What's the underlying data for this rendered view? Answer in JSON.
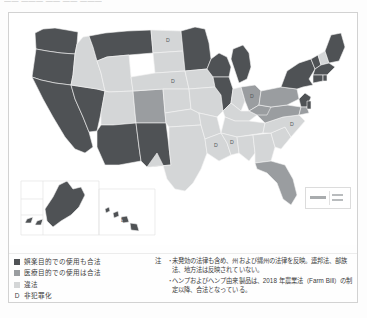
{
  "page": {
    "title_cutoff": "—— ——— ——  —— ———",
    "background_color": "#ffffff",
    "frame_color": "#d2d2d2"
  },
  "map": {
    "name": "united-states-cannabis-legality-choropleth",
    "projection_note": "contiguous US with Alaska and Hawaii insets",
    "colors": {
      "recreational_legal": "#4f5255",
      "medical_legal": "#9a9da0",
      "illegal": "#d4d6d7",
      "border": "#f2f2f2",
      "ocean": "#ffffff"
    },
    "state_letter_label": "D",
    "states_with_letter_label": [
      "ND",
      "NE",
      "OH",
      "NC",
      "MS",
      "LA",
      "HI"
    ]
  },
  "legend": {
    "items": [
      {
        "swatch": "rec",
        "label": "娯楽目的での使用も合法"
      },
      {
        "swatch": "med",
        "label": "医療目的での使用は合法"
      },
      {
        "swatch": "ill",
        "label": "違法"
      },
      {
        "swatch": "letter",
        "key": "D",
        "label": "非犯罪化"
      }
    ]
  },
  "notes": {
    "heading": "注",
    "items": [
      "未発効の法律も含め、州および縄州の法律を反映。連邦法、部族法、地方法は反映されていない。",
      "ヘンプおよびヘンプ由来製品は、2018 年農業法（Farm Bill）の制定以降、合法となっている。"
    ],
    "bullet": "・"
  },
  "scalebar": {
    "name": "map-scale-bar"
  }
}
